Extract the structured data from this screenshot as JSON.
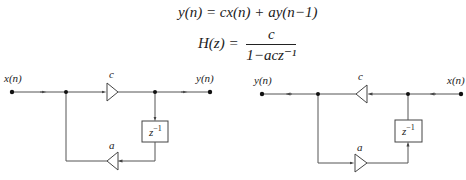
{
  "equations": {
    "difference": "y(n) = cx(n) + ay(n−1)",
    "transfer_lhs": "H(z) =",
    "transfer_num": "c",
    "transfer_den": "1−acz⁻¹"
  },
  "left_diagram": {
    "input_label": "x(n)",
    "output_label": "y(n)",
    "forward_gain_label": "c",
    "feedback_gain_label": "a",
    "delay_label": "z",
    "delay_exp": "−1"
  },
  "right_diagram": {
    "input_label": "x(n)",
    "output_label": "y(n)",
    "forward_gain_label": "c",
    "feedback_gain_label": "a",
    "delay_label": "z",
    "delay_exp": "−1"
  },
  "colors": {
    "line": "#555555",
    "text": "#222222",
    "background": "#ffffff"
  }
}
